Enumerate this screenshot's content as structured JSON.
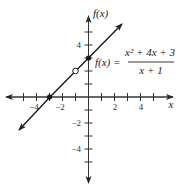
{
  "graph": {
    "x_axis_label": "x",
    "y_axis_label": "f(x)",
    "x_tick_labels": [
      {
        "value": -4,
        "text": "−4"
      },
      {
        "value": -2,
        "text": "−2"
      },
      {
        "value": 2,
        "text": "2"
      },
      {
        "value": 4,
        "text": "4"
      }
    ],
    "y_tick_labels": [
      {
        "value": 4,
        "text": "4"
      },
      {
        "value": -2,
        "text": "−2"
      },
      {
        "value": -4,
        "text": "−4"
      }
    ],
    "formula": {
      "lhs": "f(x) =",
      "numerator": "x² + 4x + 3",
      "denominator": "x + 1"
    },
    "line": {
      "slope": 1,
      "intercept": 3,
      "x_from": -5.35,
      "x_to": 2.6
    },
    "closed_points": [
      {
        "x": -3,
        "y": 0
      },
      {
        "x": 0,
        "y": 3
      }
    ],
    "open_points": [
      {
        "x": -1,
        "y": 2
      }
    ],
    "colors": {
      "axis": "#333333",
      "line": "#1a1a1a"
    }
  }
}
